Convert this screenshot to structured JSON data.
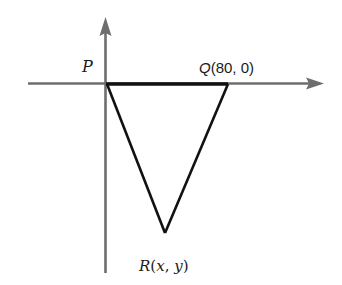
{
  "diagram": {
    "type": "coordinate-triangle",
    "axes": {
      "horizontal": {
        "direction": "right",
        "color": "#6e6e6e"
      },
      "vertical": {
        "direction": "up",
        "color": "#6e6e6e"
      }
    },
    "triangle": {
      "stroke_color": "#111111",
      "vertices": [
        {
          "name": "P",
          "label": "P",
          "coords_text": "",
          "at_origin": true
        },
        {
          "name": "Q",
          "label": "Q",
          "coords_text": "(80, 0)",
          "x": 80,
          "y": 0
        },
        {
          "name": "R",
          "label": "R",
          "coords_text": "(x, y)",
          "x": "x",
          "y": "y"
        }
      ]
    },
    "labels": {
      "p": "P",
      "q_letter": "Q",
      "q_coords": "(80, 0)",
      "r_letter": "R",
      "r_coords_open": "(",
      "r_x": "x",
      "r_comma": ", ",
      "r_y": "y",
      "r_coords_close": ")"
    }
  }
}
